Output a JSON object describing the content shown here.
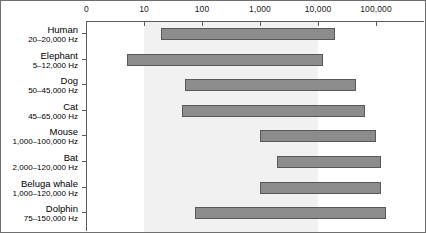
{
  "chart_data": {
    "type": "bar",
    "orientation": "horizontal",
    "title": "",
    "subtitle": "",
    "xlabel": "",
    "ylabel": "",
    "xscale": "log",
    "grid": false,
    "legend": null,
    "axis": {
      "tick_labels": [
        "0",
        "10",
        "100",
        "1,000",
        "10,000",
        "100,000"
      ],
      "tick_values": [
        0,
        10,
        100,
        1000,
        10000,
        100000
      ],
      "xlim": [
        0,
        200000
      ],
      "unit": "Hz"
    },
    "shaded_band": {
      "label": "",
      "from": 10,
      "to": 10000,
      "color": "#f1f1f1"
    },
    "bar_color": "#8c8c8c",
    "bar_edge_color": "#595959",
    "categories": [
      "Human",
      "Elephant",
      "Dog",
      "Cat",
      "Mouse",
      "Bat",
      "Beluga whale",
      "Dolphin"
    ],
    "range_labels": [
      "20–20,000 Hz",
      "5–12,000 Hz",
      "50–45,000 Hz",
      "45–65,000 Hz",
      "1,000–100,000 Hz",
      "2,000–120,000 Hz",
      "1,000–120,000 Hz",
      "75–150,000 Hz"
    ],
    "bars": [
      {
        "name": "Human",
        "range_label": "20–20,000 Hz",
        "low": 20,
        "high": 20000
      },
      {
        "name": "Elephant",
        "range_label": "5–12,000 Hz",
        "low": 5,
        "high": 12000
      },
      {
        "name": "Dog",
        "range_label": "50–45,000 Hz",
        "low": 50,
        "high": 45000
      },
      {
        "name": "Cat",
        "range_label": "45–65,000 Hz",
        "low": 45,
        "high": 65000
      },
      {
        "name": "Mouse",
        "range_label": "1,000–100,000 Hz",
        "low": 1000,
        "high": 100000
      },
      {
        "name": "Bat",
        "range_label": "2,000–120,000 Hz",
        "low": 2000,
        "high": 120000
      },
      {
        "name": "Beluga whale",
        "range_label": "1,000–120,000 Hz",
        "low": 1000,
        "high": 120000
      },
      {
        "name": "Dolphin",
        "range_label": "75–150,000 Hz",
        "low": 75,
        "high": 150000
      }
    ]
  }
}
